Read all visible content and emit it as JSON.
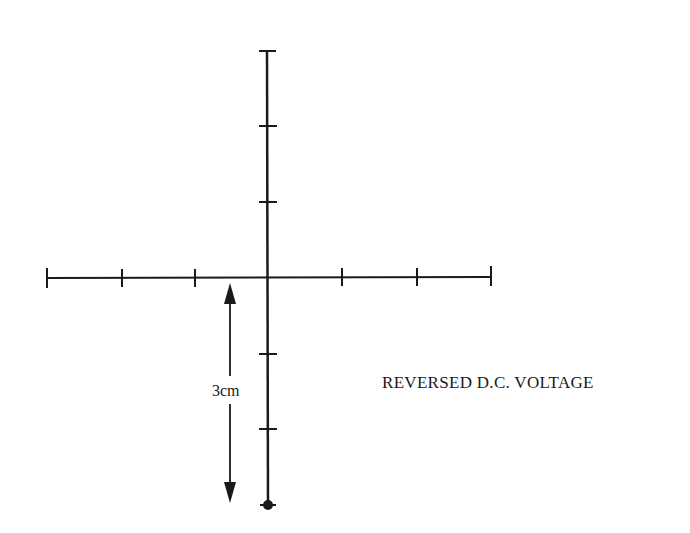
{
  "diagram": {
    "caption": "REVERSED D.C. VOLTAGE",
    "dimension_label": "3cm",
    "colors": {
      "line": "#1a1a1a",
      "background": "#ffffff"
    },
    "axes": {
      "origin": [
        268,
        277
      ],
      "horizontal": {
        "x_start": 47,
        "x_end": 491,
        "ticks_x": [
          47,
          122,
          195,
          342,
          417,
          491
        ]
      },
      "vertical": {
        "y_top": 51,
        "y_bottom": 505,
        "ticks_y": [
          51,
          126,
          202,
          354,
          429
        ]
      }
    },
    "trace_point": {
      "x": 268,
      "y": 505,
      "description": "spot deflected 3cm downward"
    },
    "dimension_arrow": {
      "x": 230,
      "y_top": 283,
      "y_bottom": 503
    }
  }
}
